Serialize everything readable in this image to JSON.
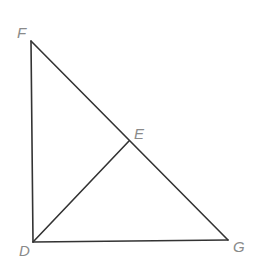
{
  "diagram": {
    "type": "geometry",
    "colors": {
      "line": "#333333",
      "label": "#8a8a8a",
      "background": "#ffffff"
    },
    "points": {
      "F": {
        "label": "F",
        "x": 31,
        "y": 41,
        "label_x": 17,
        "label_y": 38
      },
      "D": {
        "label": "D",
        "x": 33,
        "y": 242,
        "label_x": 19,
        "label_y": 256
      },
      "G": {
        "label": "G",
        "x": 228,
        "y": 240,
        "label_x": 233,
        "label_y": 252
      },
      "E": {
        "label": "E",
        "x": 129,
        "y": 141,
        "label_x": 134,
        "label_y": 139
      }
    },
    "segments": [
      {
        "id": "FD",
        "from": "F",
        "to": "D"
      },
      {
        "id": "FG",
        "from": "F",
        "to": "G"
      },
      {
        "id": "DG",
        "from": "D",
        "to": "G"
      },
      {
        "id": "DE",
        "from": "D",
        "to": "E"
      }
    ]
  }
}
